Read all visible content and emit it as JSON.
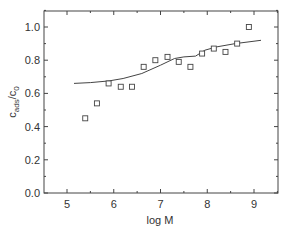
{
  "chart_data": {
    "type": "scatter",
    "title": "",
    "xlabel": "log M",
    "ylabel_main": "c",
    "ylabel_sub1": "ads",
    "ylabel_slash": "/c",
    "ylabel_sub2": "0",
    "xlim": [
      4.5,
      9.5
    ],
    "ylim": [
      0.0,
      1.1
    ],
    "grid": false,
    "legend": null,
    "x_ticks": [
      5,
      6,
      7,
      8,
      9
    ],
    "x_tick_labels": [
      "5",
      "6",
      "7",
      "8",
      "9"
    ],
    "y_ticks": [
      0.0,
      0.2,
      0.4,
      0.6,
      0.8,
      1.0
    ],
    "y_tick_labels": [
      "0.0",
      "0.2",
      "0.4",
      "0.6",
      "0.8",
      "1.0"
    ],
    "series": [
      {
        "name": "measured",
        "kind": "markers",
        "marker": "open-square",
        "x": [
          5.39,
          5.64,
          5.89,
          6.15,
          6.39,
          6.64,
          6.89,
          7.15,
          7.39,
          7.64,
          7.89,
          8.14,
          8.39,
          8.64,
          8.89
        ],
        "y": [
          0.45,
          0.54,
          0.66,
          0.64,
          0.64,
          0.76,
          0.8,
          0.82,
          0.79,
          0.76,
          0.84,
          0.87,
          0.85,
          0.9,
          1.0
        ]
      },
      {
        "name": "model",
        "kind": "line",
        "x": [
          5.15,
          5.5,
          5.9,
          6.2,
          6.6,
          7.0,
          7.3,
          7.5,
          7.75,
          7.95,
          8.2,
          8.6,
          9.15
        ],
        "y": [
          0.66,
          0.665,
          0.675,
          0.69,
          0.72,
          0.77,
          0.81,
          0.82,
          0.825,
          0.86,
          0.88,
          0.9,
          0.92
        ]
      }
    ]
  },
  "colors": {
    "axis": "#444444",
    "series": "#444444",
    "background": "#ffffff"
  }
}
